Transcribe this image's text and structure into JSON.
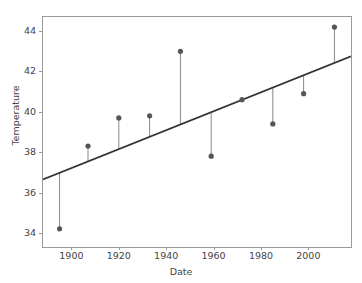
{
  "chart_data": {
    "type": "scatter",
    "title": "",
    "xlabel": "Date",
    "ylabel": "Temperature",
    "xlim": [
      1888,
      2018
    ],
    "ylim": [
      33.3,
      44.7
    ],
    "xticks": [
      1900,
      1920,
      1940,
      1960,
      1980,
      2000
    ],
    "xtick_labels": [
      "1900",
      "1920",
      "1940",
      "1960",
      "1980",
      "2000"
    ],
    "yticks": [
      34,
      36,
      38,
      40,
      42,
      44
    ],
    "ytick_labels": [
      "34",
      "36",
      "38",
      "40",
      "42",
      "44"
    ],
    "grid": false,
    "legend": null,
    "x": [
      1895,
      1907,
      1920,
      1933,
      1946,
      1959,
      1972,
      1985,
      1998,
      2011
    ],
    "values": [
      34.2,
      38.3,
      39.7,
      39.8,
      43.0,
      37.8,
      40.6,
      39.4,
      40.9,
      44.2
    ],
    "series": [
      {
        "name": "Temperature",
        "marker": "circle",
        "marker_color": "#555555",
        "stem_color": "#888888",
        "values": [
          34.2,
          38.3,
          39.7,
          39.8,
          43.0,
          37.8,
          40.6,
          39.4,
          40.9,
          44.2
        ]
      },
      {
        "name": "trend line",
        "type": "line",
        "color": "#333333",
        "x": [
          1888,
          2018
        ],
        "values": [
          36.65,
          42.75
        ]
      }
    ],
    "annotations": []
  },
  "axis": {
    "frame_color": "#9a9a9a",
    "tick_color": "#9a9a9a",
    "label_color": "#444444"
  }
}
